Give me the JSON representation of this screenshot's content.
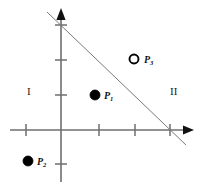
{
  "figure": {
    "width": 201,
    "height": 190,
    "background_color": "#ffffff",
    "axis_color": "#6e6e6e",
    "line_color": "#7a7a7a",
    "point_color": "#000000",
    "text_color": "#111111"
  },
  "axes": {
    "origin": {
      "x": 61,
      "y": 130
    },
    "x_axis": {
      "name": "x-axis",
      "start_x": 10,
      "end_x": 194,
      "y": 130,
      "arrow": "right",
      "tick_positions_px": [
        26,
        99,
        135,
        170
      ],
      "tick_half_length": 6
    },
    "y_axis": {
      "name": "y-axis",
      "x": 61,
      "start_y": 182,
      "end_y": 8,
      "arrow": "up",
      "tick_positions_px": [
        25,
        60,
        95,
        164
      ],
      "tick_half_length": 6
    }
  },
  "boundary_line": {
    "name": "boundary-line",
    "x1": 47,
    "y1": 12,
    "x2": 186,
    "y2": 145,
    "crosses_y_axis_at_px": {
      "x": 61,
      "y": 25
    },
    "crosses_x_axis_at_px": {
      "x": 170,
      "y": 130
    },
    "style": "solid",
    "stroke_width": 1
  },
  "points": [
    {
      "id": "p1",
      "label": "P",
      "subscript": "1",
      "fill": "solid",
      "cx": 95,
      "cy": 95,
      "r": 5,
      "label_x": 104,
      "label_y": 91
    },
    {
      "id": "p2",
      "label": "P",
      "subscript": "2",
      "fill": "solid",
      "cx": 28,
      "cy": 161,
      "r": 5,
      "label_x": 37,
      "label_y": 157
    },
    {
      "id": "p3",
      "label": "P",
      "subscript": "3",
      "fill": "hollow",
      "cx": 134,
      "cy": 59,
      "r": 4.5,
      "label_x": 144,
      "label_y": 55
    }
  ],
  "regions": [
    {
      "id": "region-1",
      "label": "I",
      "x": 27,
      "y": 86
    },
    {
      "id": "region-2",
      "label": "II",
      "x": 170,
      "y": 86
    }
  ]
}
